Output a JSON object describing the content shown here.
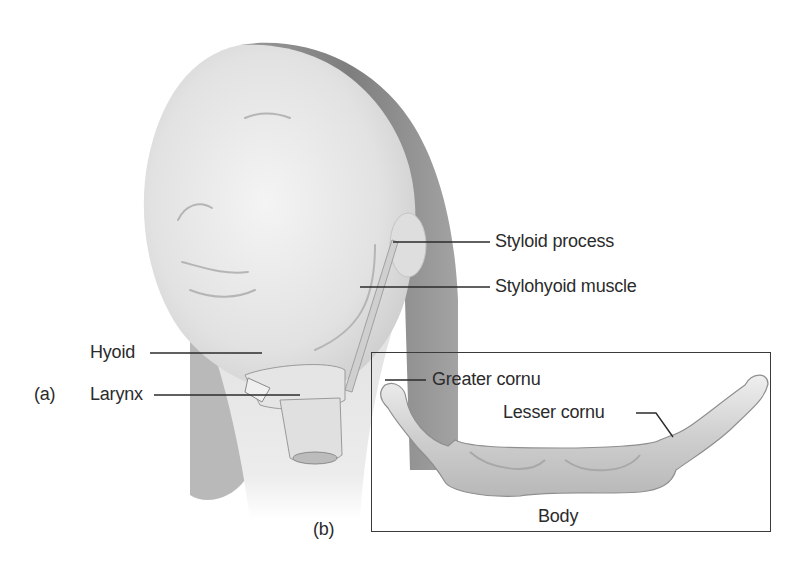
{
  "figure": {
    "panels": [
      {
        "id": "a",
        "label": "(a)"
      },
      {
        "id": "b",
        "label": "(b)"
      }
    ],
    "panel_a": {
      "subject": "head-and-neck-illustration",
      "labels": {
        "styloid_process": "Styloid process",
        "stylohyoid_muscle": "Stylohyoid muscle",
        "hyoid": "Hyoid",
        "larynx": "Larynx"
      }
    },
    "panel_b": {
      "subject": "hyoid-bone-illustration",
      "labels": {
        "greater_cornu": "Greater cornu",
        "lesser_cornu": "Lesser cornu",
        "body": "Body"
      }
    },
    "colors": {
      "background": "#ffffff",
      "skin": "#e6e6e6",
      "hair": "#8c8c8c",
      "bone": "#d4d4d4",
      "leader_line": "#2b2b2b",
      "text": "#2b2b2b"
    }
  }
}
